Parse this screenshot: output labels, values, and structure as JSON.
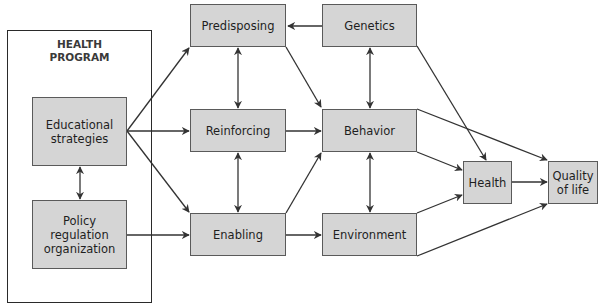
{
  "diagram": {
    "colors": {
      "node_fill": "#d5d5d5",
      "node_border": "#5a5a5a",
      "arrow": "#333333",
      "background": "#ffffff"
    },
    "group": {
      "label": "HEALTH\nPROGRAM",
      "box": {
        "x": 7,
        "y": 30,
        "w": 145,
        "h": 273
      }
    },
    "nodes": {
      "educational": {
        "label": "Educational\nstrategies",
        "x": 32,
        "y": 97,
        "w": 95,
        "h": 69
      },
      "policy": {
        "label": "Policy\nregulation\norganization",
        "x": 32,
        "y": 200,
        "w": 95,
        "h": 69
      },
      "predisposing": {
        "label": "Predisposing",
        "x": 190,
        "y": 4,
        "w": 96,
        "h": 43
      },
      "reinforcing": {
        "label": "Reinforcing",
        "x": 190,
        "y": 109,
        "w": 96,
        "h": 43
      },
      "enabling": {
        "label": "Enabling",
        "x": 190,
        "y": 213,
        "w": 96,
        "h": 43
      },
      "genetics": {
        "label": "Genetics",
        "x": 322,
        "y": 4,
        "w": 95,
        "h": 43
      },
      "behavior": {
        "label": "Behavior",
        "x": 322,
        "y": 109,
        "w": 95,
        "h": 43
      },
      "environment": {
        "label": "Environment",
        "x": 322,
        "y": 213,
        "w": 95,
        "h": 43
      },
      "health": {
        "label": "Health",
        "x": 463,
        "y": 161,
        "w": 49,
        "h": 43
      },
      "quality": {
        "label": "Quality\nof life",
        "x": 548,
        "y": 161,
        "w": 50,
        "h": 43
      }
    },
    "edges": [
      {
        "from": "educational",
        "to": "predisposing",
        "type": "directed"
      },
      {
        "from": "educational",
        "to": "reinforcing",
        "type": "directed"
      },
      {
        "from": "educational",
        "to": "enabling",
        "type": "directed"
      },
      {
        "from": "educational",
        "to": "policy",
        "type": "bidirectional"
      },
      {
        "from": "policy",
        "to": "enabling",
        "type": "directed"
      },
      {
        "from": "genetics",
        "to": "predisposing",
        "type": "directed"
      },
      {
        "from": "predisposing",
        "to": "reinforcing",
        "type": "bidirectional"
      },
      {
        "from": "reinforcing",
        "to": "enabling",
        "type": "bidirectional"
      },
      {
        "from": "predisposing",
        "to": "behavior",
        "type": "directed"
      },
      {
        "from": "reinforcing",
        "to": "behavior",
        "type": "directed"
      },
      {
        "from": "enabling",
        "to": "behavior",
        "type": "directed"
      },
      {
        "from": "enabling",
        "to": "environment",
        "type": "directed"
      },
      {
        "from": "genetics",
        "to": "behavior",
        "type": "bidirectional"
      },
      {
        "from": "behavior",
        "to": "environment",
        "type": "bidirectional"
      },
      {
        "from": "genetics",
        "to": "health",
        "type": "directed"
      },
      {
        "from": "behavior",
        "to": "health",
        "type": "directed"
      },
      {
        "from": "environment",
        "to": "health",
        "type": "directed"
      },
      {
        "from": "behavior",
        "to": "quality",
        "type": "directed"
      },
      {
        "from": "environment",
        "to": "quality",
        "type": "directed"
      },
      {
        "from": "health",
        "to": "quality",
        "type": "directed"
      }
    ]
  }
}
